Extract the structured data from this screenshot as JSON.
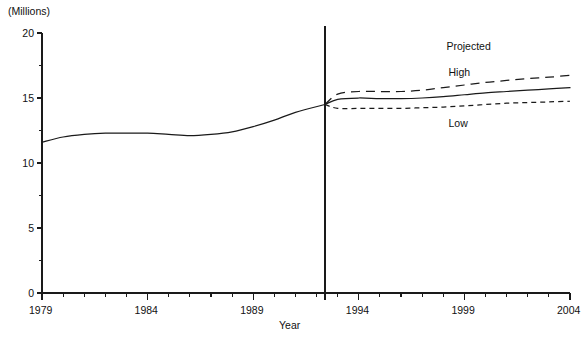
{
  "chart_data": {
    "type": "line",
    "title": "",
    "unit_label": "(Millions)",
    "xlabel": "Year",
    "ylabel": "",
    "xlim": [
      1979,
      2004
    ],
    "ylim": [
      0,
      20
    ],
    "ytick_labels": [
      "0",
      "5",
      "10",
      "15",
      "20"
    ],
    "ytick_values": [
      0,
      5,
      10,
      15,
      20
    ],
    "yminor_values": [
      2.5,
      7.5,
      12.5,
      17.5
    ],
    "xtick_labels": [
      "1979",
      "1984",
      "1989",
      "1994",
      "1999",
      "2004"
    ],
    "xtick_values": [
      1979,
      1984,
      1989,
      1994,
      1999,
      2004
    ],
    "xminor_step": 1,
    "grid": false,
    "legend_position": "inline-annotations",
    "annotations": [
      {
        "name": "projected",
        "text": "Projected",
        "x": 1999.0,
        "y": 18.9
      },
      {
        "name": "high",
        "text": "High",
        "x": 1999.1,
        "y": 16.9
      },
      {
        "name": "low",
        "text": "Low",
        "x": 1999.1,
        "y": 13.0
      }
    ],
    "divider": {
      "x": 1992.4,
      "label": ""
    },
    "series": [
      {
        "name": "Actual",
        "style": "solid",
        "x": [
          1979,
          1980,
          1981,
          1982,
          1983,
          1984,
          1985,
          1986,
          1987,
          1988,
          1989,
          1990,
          1991,
          1992.4
        ],
        "values": [
          11.6,
          12.0,
          12.2,
          12.3,
          12.3,
          12.3,
          12.2,
          12.1,
          12.2,
          12.4,
          12.8,
          13.3,
          13.9,
          14.5
        ]
      },
      {
        "name": "Projected middle",
        "style": "solid",
        "x": [
          1992.4,
          1993,
          1994,
          1995,
          1996,
          1997,
          1998,
          1999,
          2000,
          2001,
          2002,
          2003,
          2004
        ],
        "values": [
          14.5,
          14.9,
          15.0,
          14.95,
          14.95,
          15.0,
          15.1,
          15.25,
          15.4,
          15.5,
          15.6,
          15.7,
          15.8
        ]
      },
      {
        "name": "High",
        "style": "dashed-long",
        "x": [
          1992.4,
          1993,
          1994,
          1995,
          1996,
          1997,
          1998,
          1999,
          2000,
          2001,
          2002,
          2003,
          2004
        ],
        "values": [
          14.5,
          15.3,
          15.5,
          15.5,
          15.5,
          15.6,
          15.8,
          16.0,
          16.2,
          16.35,
          16.5,
          16.6,
          16.75
        ]
      },
      {
        "name": "Low",
        "style": "dashed-short",
        "x": [
          1992.4,
          1993,
          1994,
          1995,
          1996,
          1997,
          1998,
          1999,
          2000,
          2001,
          2002,
          2003,
          2004
        ],
        "values": [
          14.5,
          14.2,
          14.2,
          14.2,
          14.2,
          14.25,
          14.3,
          14.4,
          14.5,
          14.6,
          14.65,
          14.7,
          14.75
        ]
      }
    ],
    "colors": {
      "line": "#1a1a1a",
      "axis": "#1a1a1a",
      "background": "#ffffff"
    }
  }
}
